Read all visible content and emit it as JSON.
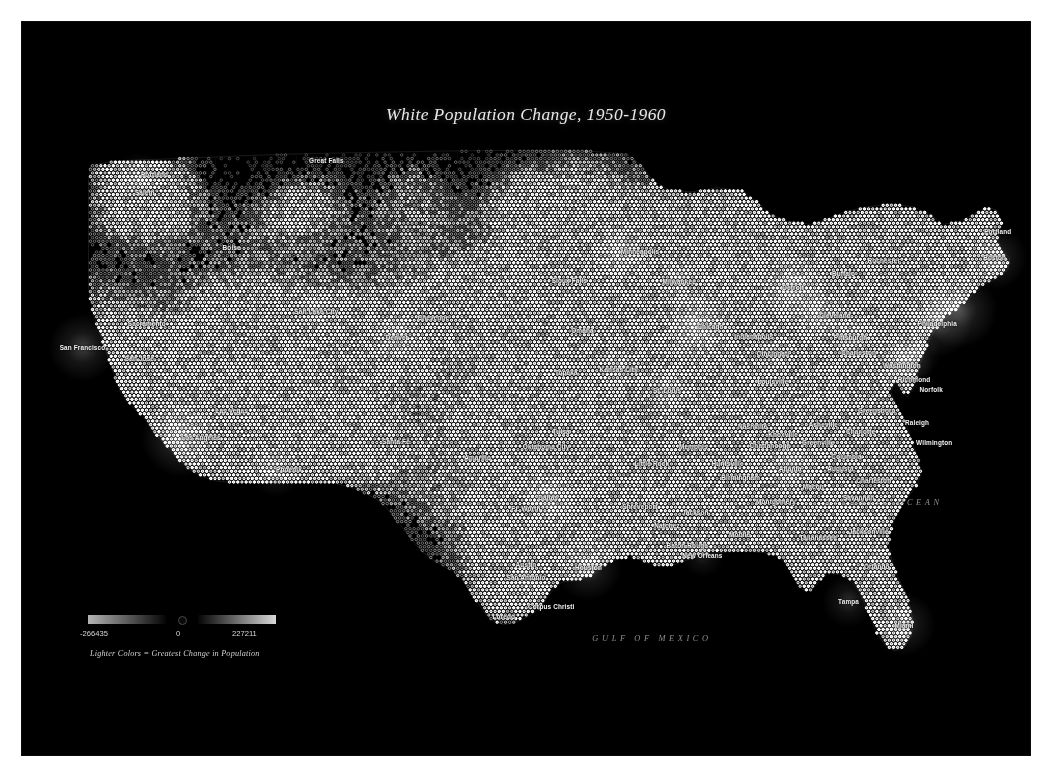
{
  "page": {
    "background_color": "#ffffff",
    "panel_color": "#000000"
  },
  "map": {
    "title": "White Population Change, 1950-1960",
    "projection_note": "United States dot-density hex grid",
    "ocean_labels": [
      {
        "text": "ATLANTIC OCEAN",
        "x": 0.855,
        "y": 0.655
      },
      {
        "text": "GULF OF MEXICO",
        "x": 0.625,
        "y": 0.84
      }
    ],
    "cities": [
      {
        "name": "Portland",
        "x": 0.118,
        "y": 0.208,
        "anchor": "left"
      },
      {
        "name": "Salem",
        "x": 0.112,
        "y": 0.232,
        "anchor": "left"
      },
      {
        "name": "Great Falls",
        "x": 0.302,
        "y": 0.188,
        "anchor": "center"
      },
      {
        "name": "Boise",
        "x": 0.208,
        "y": 0.307,
        "anchor": "center"
      },
      {
        "name": "Sacramento",
        "x": 0.105,
        "y": 0.41,
        "anchor": "left"
      },
      {
        "name": "San Francisco",
        "x": 0.06,
        "y": 0.444,
        "anchor": "center"
      },
      {
        "name": "San Jose",
        "x": 0.102,
        "y": 0.459,
        "anchor": "left"
      },
      {
        "name": "Salt Lake City",
        "x": 0.292,
        "y": 0.394,
        "anchor": "center"
      },
      {
        "name": "Cheyenne",
        "x": 0.408,
        "y": 0.402,
        "anchor": "center"
      },
      {
        "name": "Denver",
        "x": 0.372,
        "y": 0.43,
        "anchor": "center"
      },
      {
        "name": "Las Vegas",
        "x": 0.208,
        "y": 0.53,
        "anchor": "center"
      },
      {
        "name": "Los Angeles",
        "x": 0.158,
        "y": 0.566,
        "anchor": "left"
      },
      {
        "name": "Santa Fe",
        "x": 0.371,
        "y": 0.572,
        "anchor": "center"
      },
      {
        "name": "Phoenix",
        "x": 0.252,
        "y": 0.61,
        "anchor": "left"
      },
      {
        "name": "Amarillo",
        "x": 0.452,
        "y": 0.593,
        "anchor": "center"
      },
      {
        "name": "Minneapolis",
        "x": 0.594,
        "y": 0.312,
        "anchor": "left"
      },
      {
        "name": "Sioux Falls",
        "x": 0.543,
        "y": 0.352,
        "anchor": "center"
      },
      {
        "name": "Milwaukee",
        "x": 0.652,
        "y": 0.353,
        "anchor": "center"
      },
      {
        "name": "Detroit",
        "x": 0.765,
        "y": 0.362,
        "anchor": "center"
      },
      {
        "name": "Buffalo",
        "x": 0.815,
        "y": 0.343,
        "anchor": "center"
      },
      {
        "name": "Rochester",
        "x": 0.855,
        "y": 0.325,
        "anchor": "center"
      },
      {
        "name": "Boston",
        "x": 0.965,
        "y": 0.321,
        "anchor": "center"
      },
      {
        "name": "Portland",
        "x": 0.968,
        "y": 0.285,
        "anchor": "center"
      },
      {
        "name": "Omaha",
        "x": 0.556,
        "y": 0.42,
        "anchor": "center"
      },
      {
        "name": "Chicago",
        "x": 0.67,
        "y": 0.415,
        "anchor": "left"
      },
      {
        "name": "Cleveland",
        "x": 0.791,
        "y": 0.4,
        "anchor": "left"
      },
      {
        "name": "Cincinnati",
        "x": 0.745,
        "y": 0.452,
        "anchor": "center"
      },
      {
        "name": "Pittsburgh",
        "x": 0.822,
        "y": 0.43,
        "anchor": "center"
      },
      {
        "name": "Philadelphia",
        "x": 0.908,
        "y": 0.41,
        "anchor": "center"
      },
      {
        "name": "Washington",
        "x": 0.873,
        "y": 0.468,
        "anchor": "center"
      },
      {
        "name": "Topeka",
        "x": 0.54,
        "y": 0.478,
        "anchor": "center"
      },
      {
        "name": "Kansas City",
        "x": 0.592,
        "y": 0.474,
        "anchor": "center"
      },
      {
        "name": "Indianapolis",
        "x": 0.726,
        "y": 0.429,
        "anchor": "center"
      },
      {
        "name": "Louisville",
        "x": 0.745,
        "y": 0.49,
        "anchor": "center"
      },
      {
        "name": "Richmond",
        "x": 0.885,
        "y": 0.487,
        "anchor": "center"
      },
      {
        "name": "Norfolk",
        "x": 0.902,
        "y": 0.501,
        "anchor": "center"
      },
      {
        "name": "St. Louis",
        "x": 0.64,
        "y": 0.502,
        "anchor": "center"
      },
      {
        "name": "Tulsa",
        "x": 0.535,
        "y": 0.558,
        "anchor": "center"
      },
      {
        "name": "Oklahoma City",
        "x": 0.52,
        "y": 0.578,
        "anchor": "center"
      },
      {
        "name": "Little Rock",
        "x": 0.625,
        "y": 0.601,
        "anchor": "center"
      },
      {
        "name": "Memphis",
        "x": 0.666,
        "y": 0.578,
        "anchor": "center"
      },
      {
        "name": "Nashville",
        "x": 0.725,
        "y": 0.551,
        "anchor": "center"
      },
      {
        "name": "Knoxville",
        "x": 0.755,
        "y": 0.562,
        "anchor": "center"
      },
      {
        "name": "Asheville",
        "x": 0.795,
        "y": 0.548,
        "anchor": "center"
      },
      {
        "name": "Greensboro",
        "x": 0.848,
        "y": 0.53,
        "anchor": "center"
      },
      {
        "name": "Raleigh",
        "x": 0.888,
        "y": 0.546,
        "anchor": "center"
      },
      {
        "name": "Charlotte",
        "x": 0.832,
        "y": 0.558,
        "anchor": "center"
      },
      {
        "name": "Chattanooga",
        "x": 0.742,
        "y": 0.577,
        "anchor": "center"
      },
      {
        "name": "Greenville",
        "x": 0.79,
        "y": 0.573,
        "anchor": "center"
      },
      {
        "name": "Wilmington",
        "x": 0.905,
        "y": 0.573,
        "anchor": "center"
      },
      {
        "name": "Charleston",
        "x": 0.83,
        "y": 0.45,
        "anchor": "center"
      },
      {
        "name": "Columbia",
        "x": 0.818,
        "y": 0.592,
        "anchor": "center"
      },
      {
        "name": "Huntsville",
        "x": 0.7,
        "y": 0.602,
        "anchor": "center"
      },
      {
        "name": "Atlanta",
        "x": 0.762,
        "y": 0.608,
        "anchor": "center"
      },
      {
        "name": "Augusta",
        "x": 0.812,
        "y": 0.608,
        "anchor": "center"
      },
      {
        "name": "Birmingham",
        "x": 0.713,
        "y": 0.621,
        "anchor": "center"
      },
      {
        "name": "Charleston",
        "x": 0.845,
        "y": 0.625,
        "anchor": "center"
      },
      {
        "name": "Macon",
        "x": 0.785,
        "y": 0.633,
        "anchor": "center"
      },
      {
        "name": "Savannah",
        "x": 0.83,
        "y": 0.648,
        "anchor": "center"
      },
      {
        "name": "Montgomery",
        "x": 0.748,
        "y": 0.653,
        "anchor": "center"
      },
      {
        "name": "Dallas",
        "x": 0.522,
        "y": 0.648,
        "anchor": "center"
      },
      {
        "name": "Ft. Worth",
        "x": 0.5,
        "y": 0.663,
        "anchor": "center"
      },
      {
        "name": "Shreveport",
        "x": 0.613,
        "y": 0.66,
        "anchor": "center"
      },
      {
        "name": "Jackson",
        "x": 0.668,
        "y": 0.668,
        "anchor": "center"
      },
      {
        "name": "Natchez",
        "x": 0.64,
        "y": 0.686,
        "anchor": "center"
      },
      {
        "name": "Mobile",
        "x": 0.712,
        "y": 0.699,
        "anchor": "center"
      },
      {
        "name": "Tallahassee",
        "x": 0.79,
        "y": 0.702,
        "anchor": "center"
      },
      {
        "name": "Jacksonville",
        "x": 0.84,
        "y": 0.694,
        "anchor": "center"
      },
      {
        "name": "Baton Rouge",
        "x": 0.66,
        "y": 0.713,
        "anchor": "center"
      },
      {
        "name": "New Orleans",
        "x": 0.675,
        "y": 0.727,
        "anchor": "center"
      },
      {
        "name": "Austin",
        "x": 0.5,
        "y": 0.74,
        "anchor": "center"
      },
      {
        "name": "San Antonio",
        "x": 0.5,
        "y": 0.757,
        "anchor": "center"
      },
      {
        "name": "Houston",
        "x": 0.562,
        "y": 0.744,
        "anchor": "center"
      },
      {
        "name": "Orlando",
        "x": 0.848,
        "y": 0.742,
        "anchor": "center"
      },
      {
        "name": "Corpus Christi",
        "x": 0.525,
        "y": 0.797,
        "anchor": "center"
      },
      {
        "name": "Loredo",
        "x": 0.478,
        "y": 0.81,
        "anchor": "center"
      },
      {
        "name": "Tampa",
        "x": 0.82,
        "y": 0.79,
        "anchor": "center"
      },
      {
        "name": "Miami",
        "x": 0.875,
        "y": 0.822,
        "anchor": "center"
      }
    ]
  },
  "legend": {
    "min_label": "-266435",
    "zero_label": "0",
    "max_label": "227211",
    "caption": "Lighter Colors = Greatest Change in Population",
    "negative_gradient_from": "#b4b4b4",
    "negative_gradient_to": "#050505",
    "positive_gradient_from": "#050505",
    "positive_gradient_to": "#d8d8d8"
  },
  "chart_data": {
    "type": "heatmap",
    "title": "White Population Change, 1950-1960",
    "value_range": [
      -266435,
      227211
    ],
    "zero_point": 0,
    "encoding": "hex dot density, brightness = magnitude of change",
    "legend_caption": "Lighter Colors = Greatest Change in Population",
    "bright_clusters": [
      {
        "place": "Los Angeles",
        "intensity": 1.0
      },
      {
        "place": "Chicago",
        "intensity": 0.95
      },
      {
        "place": "New York",
        "intensity": 0.94
      },
      {
        "place": "Detroit",
        "intensity": 0.88
      },
      {
        "place": "Philadelphia",
        "intensity": 0.85
      },
      {
        "place": "San Francisco",
        "intensity": 0.82
      },
      {
        "place": "Houston",
        "intensity": 0.8
      },
      {
        "place": "Boston",
        "intensity": 0.78
      },
      {
        "place": "Dallas",
        "intensity": 0.76
      },
      {
        "place": "Miami",
        "intensity": 0.76
      },
      {
        "place": "Washington",
        "intensity": 0.74
      },
      {
        "place": "Cleveland",
        "intensity": 0.72
      },
      {
        "place": "Minneapolis",
        "intensity": 0.7
      },
      {
        "place": "Atlanta",
        "intensity": 0.68
      },
      {
        "place": "Denver",
        "intensity": 0.66
      },
      {
        "place": "Phoenix",
        "intensity": 0.64
      },
      {
        "place": "Seattle-Portland",
        "intensity": 0.6
      },
      {
        "place": "Tampa",
        "intensity": 0.6
      },
      {
        "place": "St. Louis",
        "intensity": 0.58
      },
      {
        "place": "Baltimore",
        "intensity": 0.58
      },
      {
        "place": "Pittsburgh",
        "intensity": 0.55
      },
      {
        "place": "Milwaukee",
        "intensity": 0.55
      },
      {
        "place": "Kansas City",
        "intensity": 0.52
      },
      {
        "place": "San Antonio",
        "intensity": 0.52
      },
      {
        "place": "Cincinnati",
        "intensity": 0.5
      },
      {
        "place": "Salt Lake City",
        "intensity": 0.48
      },
      {
        "place": "New Orleans",
        "intensity": 0.48
      },
      {
        "place": "Orlando",
        "intensity": 0.46
      }
    ]
  }
}
